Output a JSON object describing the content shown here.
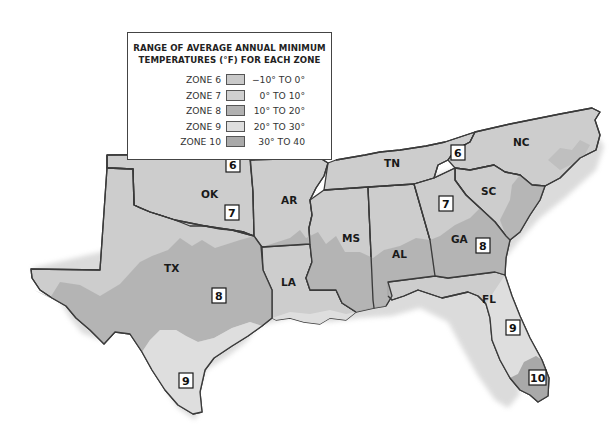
{
  "legend": {
    "title_line1": "RANGE OF AVERAGE ANNUAL MINIMUM",
    "title_line2": "TEMPERATURES (°F) FOR EACH ZONE",
    "zones": [
      {
        "name": "ZONE 6",
        "range": "−10° TO 0°",
        "color": "#c9c9c9"
      },
      {
        "name": "ZONE 7",
        "range": "0° TO 10°",
        "color": "#cfcfcf"
      },
      {
        "name": "ZONE 8",
        "range": "10° TO 20°",
        "color": "#b1b1b1"
      },
      {
        "name": "ZONE 9",
        "range": "20° TO 30°",
        "color": "#dedede"
      },
      {
        "name": "ZONE 10",
        "range": "30° TO 40",
        "color": "#a9a9a9"
      }
    ]
  },
  "states": [
    {
      "abbr": "OK",
      "x": 208,
      "y": 198
    },
    {
      "abbr": "TX",
      "x": 171,
      "y": 270
    },
    {
      "abbr": "AR",
      "x": 288,
      "y": 201
    },
    {
      "abbr": "LA",
      "x": 287,
      "y": 284
    },
    {
      "abbr": "MS",
      "x": 352,
      "y": 240
    },
    {
      "abbr": "AL",
      "x": 400,
      "y": 257
    },
    {
      "abbr": "TN",
      "x": 392,
      "y": 166
    },
    {
      "abbr": "GA",
      "x": 459,
      "y": 241
    },
    {
      "abbr": "SC",
      "x": 488,
      "y": 194
    },
    {
      "abbr": "NC",
      "x": 520,
      "y": 143
    },
    {
      "abbr": "FL",
      "x": 487,
      "y": 300
    }
  ],
  "zone_markers": [
    {
      "label": "6",
      "x": 233,
      "y": 165
    },
    {
      "label": "7",
      "x": 232,
      "y": 213
    },
    {
      "label": "8",
      "x": 219,
      "y": 296
    },
    {
      "label": "9",
      "x": 186,
      "y": 381
    },
    {
      "label": "6",
      "x": 458,
      "y": 153
    },
    {
      "label": "7",
      "x": 446,
      "y": 204
    },
    {
      "label": "8",
      "x": 483,
      "y": 246
    },
    {
      "label": "9",
      "x": 513,
      "y": 328
    },
    {
      "label": "10",
      "x": 537,
      "y": 377
    }
  ]
}
